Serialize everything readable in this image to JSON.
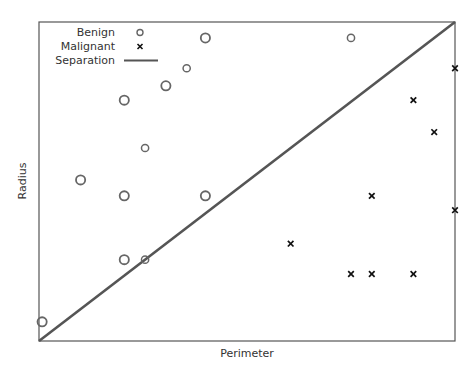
{
  "chart_data": {
    "type": "scatter",
    "title": "",
    "xlabel": "Perimeter",
    "ylabel": "Radius",
    "xlim": [
      0,
      20
    ],
    "ylim": [
      0,
      20
    ],
    "grid": false,
    "ticks_shown": false,
    "legend_position": "upper-left",
    "legend": [
      "Benign",
      "Malignant",
      "Separation"
    ],
    "series": [
      {
        "name": "Benign",
        "marker": "circle",
        "points": [
          {
            "x": 0.15,
            "y": 1.2,
            "size": "large"
          },
          {
            "x": 2.0,
            "y": 10.1,
            "size": "large"
          },
          {
            "x": 4.1,
            "y": 5.1,
            "size": "large"
          },
          {
            "x": 4.1,
            "y": 9.1,
            "size": "large"
          },
          {
            "x": 4.1,
            "y": 15.1,
            "size": "large"
          },
          {
            "x": 5.1,
            "y": 5.1,
            "size": "small"
          },
          {
            "x": 5.1,
            "y": 12.1,
            "size": "small"
          },
          {
            "x": 6.1,
            "y": 16.0,
            "size": "large"
          },
          {
            "x": 7.1,
            "y": 17.1,
            "size": "small"
          },
          {
            "x": 8.0,
            "y": 9.1,
            "size": "large"
          },
          {
            "x": 8.0,
            "y": 19.0,
            "size": "large"
          },
          {
            "x": 15.0,
            "y": 19.0,
            "size": "small"
          }
        ]
      },
      {
        "name": "Malignant",
        "marker": "x",
        "points": [
          {
            "x": 12.1,
            "y": 6.1
          },
          {
            "x": 15.0,
            "y": 4.2
          },
          {
            "x": 16.0,
            "y": 4.2
          },
          {
            "x": 16.0,
            "y": 9.1
          },
          {
            "x": 18.0,
            "y": 4.2
          },
          {
            "x": 18.0,
            "y": 15.1
          },
          {
            "x": 19.0,
            "y": 13.1
          },
          {
            "x": 20.0,
            "y": 8.2
          },
          {
            "x": 20.0,
            "y": 17.1
          }
        ]
      },
      {
        "name": "Separation",
        "type": "line",
        "points": [
          {
            "x": 0,
            "y": 0
          },
          {
            "x": 20,
            "y": 20
          }
        ]
      }
    ]
  },
  "colors": {
    "benign": "#666666",
    "malignant": "#111111",
    "separation": "#555555",
    "frame": "#555555",
    "text": "#333333"
  }
}
